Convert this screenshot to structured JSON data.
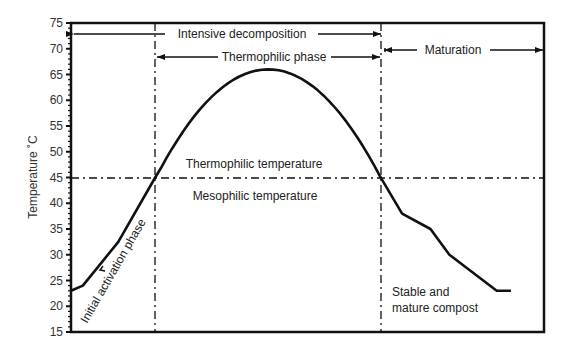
{
  "chart_data": {
    "type": "line",
    "title": "",
    "xlabel": "",
    "ylabel": "Temperature ˚C",
    "ylim": [
      15,
      75
    ],
    "yticks": [
      15,
      20,
      25,
      30,
      35,
      40,
      45,
      50,
      55,
      60,
      65,
      70,
      75
    ],
    "grid": false,
    "legend": null,
    "x_normalized_range": [
      0,
      100
    ],
    "series": [
      {
        "name": "Compost temperature",
        "x": [
          0,
          2.5,
          10,
          17.8,
          30,
          41.7,
          53.4,
          65.3,
          70,
          76,
          80,
          90,
          93
        ],
        "values": [
          23,
          24,
          32.5,
          45,
          61,
          66,
          61,
          45,
          38,
          35,
          30,
          23,
          23
        ]
      }
    ],
    "reference_lines": {
      "horizontal": [
        {
          "y": 45,
          "style": "dash-dot"
        }
      ],
      "vertical": [
        {
          "x": 17.8,
          "style": "dash-dot"
        },
        {
          "x": 65.3,
          "style": "dash-dot"
        }
      ]
    },
    "annotations": {
      "intensive": "Intensive decomposition",
      "thermophilic_phase": "Thermophilic phase",
      "maturation": "Maturation",
      "thermophilic_temp": "Thermophilic temperature",
      "mesophilic_temp": "Mesophilic temperature",
      "initial": "Initial activation phase",
      "stable_1": "Stable and",
      "stable_2": "mature compost"
    }
  }
}
